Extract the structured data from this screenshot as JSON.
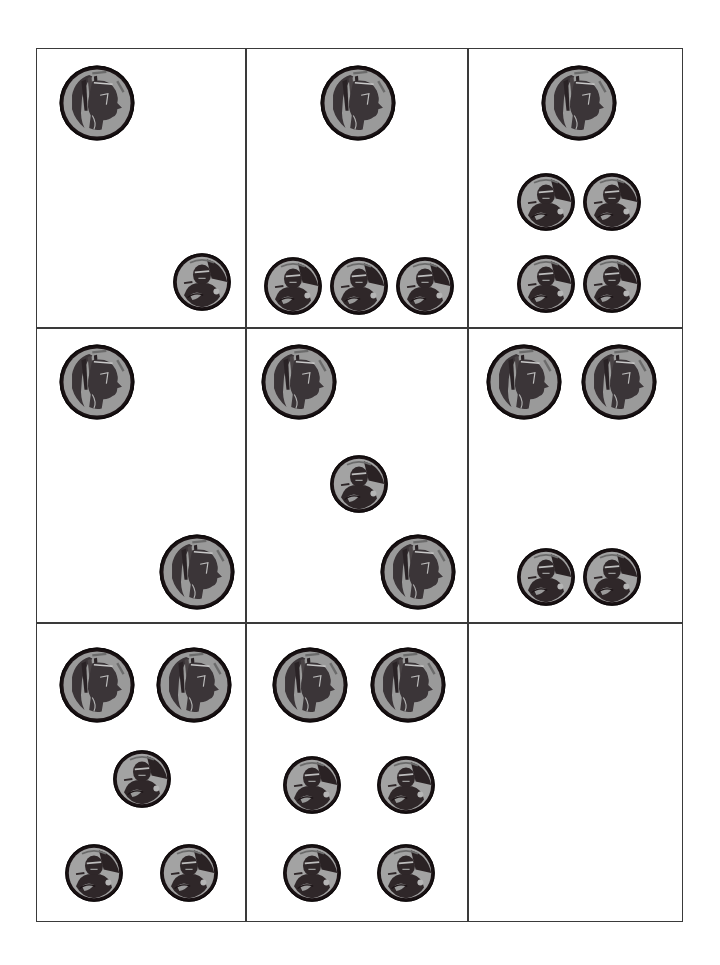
{
  "worksheet": {
    "grid": {
      "rows": 3,
      "cols": 3,
      "left": 36,
      "top": 48,
      "right": 683,
      "bottom": 922,
      "col_lines": [
        245,
        467
      ],
      "row_lines": [
        327,
        622
      ],
      "line_color": "#3a3a3a"
    },
    "coin_types": {
      "nickel": {
        "label": "nickel",
        "value_cents": 5,
        "radius": 39,
        "rim_color": "#1a1214",
        "face_color": "#9a9a9a",
        "relief_color": "#3b3538"
      },
      "penny": {
        "label": "penny",
        "value_cents": 1,
        "radius": 30,
        "rim_color": "#1a1214",
        "face_color": "#a3a3a3",
        "relief_color": "#2f2729"
      }
    },
    "cells": [
      {
        "id": "cell-1",
        "row": 0,
        "col": 0,
        "total_cents": 6,
        "coins": [
          {
            "type": "nickel",
            "cx": 96,
            "cy": 102
          },
          {
            "type": "penny",
            "cx": 201,
            "cy": 281
          }
        ]
      },
      {
        "id": "cell-2",
        "row": 0,
        "col": 1,
        "total_cents": 8,
        "coins": [
          {
            "type": "nickel",
            "cx": 357,
            "cy": 102
          },
          {
            "type": "penny",
            "cx": 292,
            "cy": 285
          },
          {
            "type": "penny",
            "cx": 358,
            "cy": 285
          },
          {
            "type": "penny",
            "cx": 424,
            "cy": 285
          }
        ]
      },
      {
        "id": "cell-3",
        "row": 0,
        "col": 2,
        "total_cents": 9,
        "coins": [
          {
            "type": "nickel",
            "cx": 578,
            "cy": 102
          },
          {
            "type": "penny",
            "cx": 545,
            "cy": 201
          },
          {
            "type": "penny",
            "cx": 611,
            "cy": 201
          },
          {
            "type": "penny",
            "cx": 545,
            "cy": 283
          },
          {
            "type": "penny",
            "cx": 611,
            "cy": 283
          }
        ]
      },
      {
        "id": "cell-4",
        "row": 1,
        "col": 0,
        "total_cents": 10,
        "coins": [
          {
            "type": "nickel",
            "cx": 96,
            "cy": 381
          },
          {
            "type": "nickel",
            "cx": 196,
            "cy": 571
          }
        ]
      },
      {
        "id": "cell-5",
        "row": 1,
        "col": 1,
        "total_cents": 11,
        "coins": [
          {
            "type": "nickel",
            "cx": 298,
            "cy": 381
          },
          {
            "type": "penny",
            "cx": 358,
            "cy": 483
          },
          {
            "type": "nickel",
            "cx": 417,
            "cy": 571
          }
        ]
      },
      {
        "id": "cell-6",
        "row": 1,
        "col": 2,
        "total_cents": 12,
        "coins": [
          {
            "type": "nickel",
            "cx": 523,
            "cy": 381
          },
          {
            "type": "nickel",
            "cx": 618,
            "cy": 381
          },
          {
            "type": "penny",
            "cx": 545,
            "cy": 576
          },
          {
            "type": "penny",
            "cx": 611,
            "cy": 576
          }
        ]
      },
      {
        "id": "cell-7",
        "row": 2,
        "col": 0,
        "total_cents": 13,
        "coins": [
          {
            "type": "nickel",
            "cx": 96,
            "cy": 684
          },
          {
            "type": "nickel",
            "cx": 193,
            "cy": 684
          },
          {
            "type": "penny",
            "cx": 141,
            "cy": 778
          },
          {
            "type": "penny",
            "cx": 93,
            "cy": 872
          },
          {
            "type": "penny",
            "cx": 188,
            "cy": 872
          }
        ]
      },
      {
        "id": "cell-8",
        "row": 2,
        "col": 1,
        "total_cents": 14,
        "coins": [
          {
            "type": "nickel",
            "cx": 309,
            "cy": 684
          },
          {
            "type": "nickel",
            "cx": 407,
            "cy": 684
          },
          {
            "type": "penny",
            "cx": 311,
            "cy": 784
          },
          {
            "type": "penny",
            "cx": 405,
            "cy": 784
          },
          {
            "type": "penny",
            "cx": 311,
            "cy": 872
          },
          {
            "type": "penny",
            "cx": 405,
            "cy": 872
          }
        ]
      },
      {
        "id": "cell-9",
        "row": 2,
        "col": 2,
        "total_cents": 0,
        "coins": []
      }
    ]
  }
}
